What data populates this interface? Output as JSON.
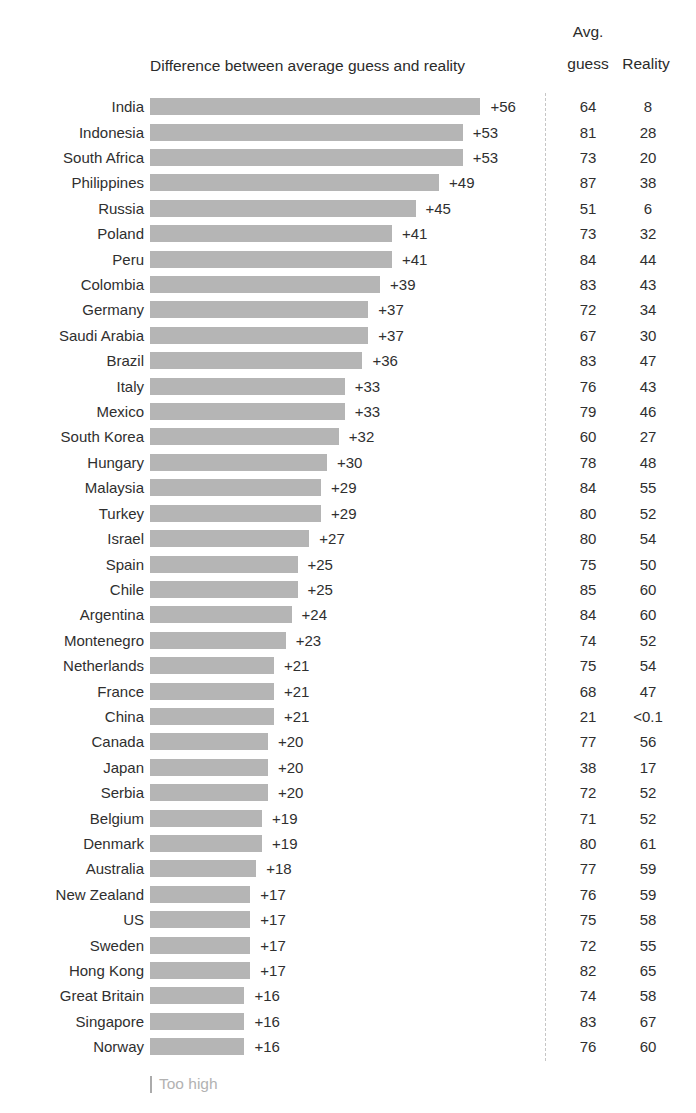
{
  "header": {
    "chart_title": "Difference between average guess and reality",
    "col_avg_line1": "Avg.",
    "col_avg_line2": "guess",
    "col_reality": "Reality"
  },
  "footer": {
    "legend_label": "Too high"
  },
  "colors": {
    "bar": "#b5b5b5",
    "text": "#2f2f2f",
    "muted_text": "#b2b2b2",
    "divider": "#c6c6c6",
    "background": "#ffffff"
  },
  "chart_data": {
    "type": "bar",
    "orientation": "horizontal",
    "title": "Difference between average guess and reality",
    "xlabel": "",
    "ylabel": "",
    "xlim": [
      0,
      60
    ],
    "grid": false,
    "legend_position": "bottom-left",
    "legend": [
      "Too high"
    ],
    "columns": [
      "Country",
      "Difference",
      "Avg. guess",
      "Reality"
    ],
    "rows": [
      {
        "country": "India",
        "difference": 56,
        "diff_label": "+56",
        "avg_guess": "64",
        "reality": "8"
      },
      {
        "country": "Indonesia",
        "difference": 53,
        "diff_label": "+53",
        "avg_guess": "81",
        "reality": "28"
      },
      {
        "country": "South Africa",
        "difference": 53,
        "diff_label": "+53",
        "avg_guess": "73",
        "reality": "20"
      },
      {
        "country": "Philippines",
        "difference": 49,
        "diff_label": "+49",
        "avg_guess": "87",
        "reality": "38"
      },
      {
        "country": "Russia",
        "difference": 45,
        "diff_label": "+45",
        "avg_guess": "51",
        "reality": "6"
      },
      {
        "country": "Poland",
        "difference": 41,
        "diff_label": "+41",
        "avg_guess": "73",
        "reality": "32"
      },
      {
        "country": "Peru",
        "difference": 41,
        "diff_label": "+41",
        "avg_guess": "84",
        "reality": "44"
      },
      {
        "country": "Colombia",
        "difference": 39,
        "diff_label": "+39",
        "avg_guess": "83",
        "reality": "43"
      },
      {
        "country": "Germany",
        "difference": 37,
        "diff_label": "+37",
        "avg_guess": "72",
        "reality": "34"
      },
      {
        "country": "Saudi Arabia",
        "difference": 37,
        "diff_label": "+37",
        "avg_guess": "67",
        "reality": "30"
      },
      {
        "country": "Brazil",
        "difference": 36,
        "diff_label": "+36",
        "avg_guess": "83",
        "reality": "47"
      },
      {
        "country": "Italy",
        "difference": 33,
        "diff_label": "+33",
        "avg_guess": "76",
        "reality": "43"
      },
      {
        "country": "Mexico",
        "difference": 33,
        "diff_label": "+33",
        "avg_guess": "79",
        "reality": "46"
      },
      {
        "country": "South Korea",
        "difference": 32,
        "diff_label": "+32",
        "avg_guess": "60",
        "reality": "27"
      },
      {
        "country": "Hungary",
        "difference": 30,
        "diff_label": "+30",
        "avg_guess": "78",
        "reality": "48"
      },
      {
        "country": "Malaysia",
        "difference": 29,
        "diff_label": "+29",
        "avg_guess": "84",
        "reality": "55"
      },
      {
        "country": "Turkey",
        "difference": 29,
        "diff_label": "+29",
        "avg_guess": "80",
        "reality": "52"
      },
      {
        "country": "Israel",
        "difference": 27,
        "diff_label": "+27",
        "avg_guess": "80",
        "reality": "54"
      },
      {
        "country": "Spain",
        "difference": 25,
        "diff_label": "+25",
        "avg_guess": "75",
        "reality": "50"
      },
      {
        "country": "Chile",
        "difference": 25,
        "diff_label": "+25",
        "avg_guess": "85",
        "reality": "60"
      },
      {
        "country": "Argentina",
        "difference": 24,
        "diff_label": "+24",
        "avg_guess": "84",
        "reality": "60"
      },
      {
        "country": "Montenegro",
        "difference": 23,
        "diff_label": "+23",
        "avg_guess": "74",
        "reality": "52"
      },
      {
        "country": "Netherlands",
        "difference": 21,
        "diff_label": "+21",
        "avg_guess": "75",
        "reality": "54"
      },
      {
        "country": "France",
        "difference": 21,
        "diff_label": "+21",
        "avg_guess": "68",
        "reality": "47"
      },
      {
        "country": "China",
        "difference": 21,
        "diff_label": "+21",
        "avg_guess": "21",
        "reality": "<0.1"
      },
      {
        "country": "Canada",
        "difference": 20,
        "diff_label": "+20",
        "avg_guess": "77",
        "reality": "56"
      },
      {
        "country": "Japan",
        "difference": 20,
        "diff_label": "+20",
        "avg_guess": "38",
        "reality": "17"
      },
      {
        "country": "Serbia",
        "difference": 20,
        "diff_label": "+20",
        "avg_guess": "72",
        "reality": "52"
      },
      {
        "country": "Belgium",
        "difference": 19,
        "diff_label": "+19",
        "avg_guess": "71",
        "reality": "52"
      },
      {
        "country": "Denmark",
        "difference": 19,
        "diff_label": "+19",
        "avg_guess": "80",
        "reality": "61"
      },
      {
        "country": "Australia",
        "difference": 18,
        "diff_label": "+18",
        "avg_guess": "77",
        "reality": "59"
      },
      {
        "country": "New Zealand",
        "difference": 17,
        "diff_label": "+17",
        "avg_guess": "76",
        "reality": "59"
      },
      {
        "country": "US",
        "difference": 17,
        "diff_label": "+17",
        "avg_guess": "75",
        "reality": "58"
      },
      {
        "country": "Sweden",
        "difference": 17,
        "diff_label": "+17",
        "avg_guess": "72",
        "reality": "55"
      },
      {
        "country": "Hong Kong",
        "difference": 17,
        "diff_label": "+17",
        "avg_guess": "82",
        "reality": "65"
      },
      {
        "country": "Great Britain",
        "difference": 16,
        "diff_label": "+16",
        "avg_guess": "74",
        "reality": "58"
      },
      {
        "country": "Singapore",
        "difference": 16,
        "diff_label": "+16",
        "avg_guess": "83",
        "reality": "67"
      },
      {
        "country": "Norway",
        "difference": 16,
        "diff_label": "+16",
        "avg_guess": "76",
        "reality": "60"
      }
    ]
  }
}
